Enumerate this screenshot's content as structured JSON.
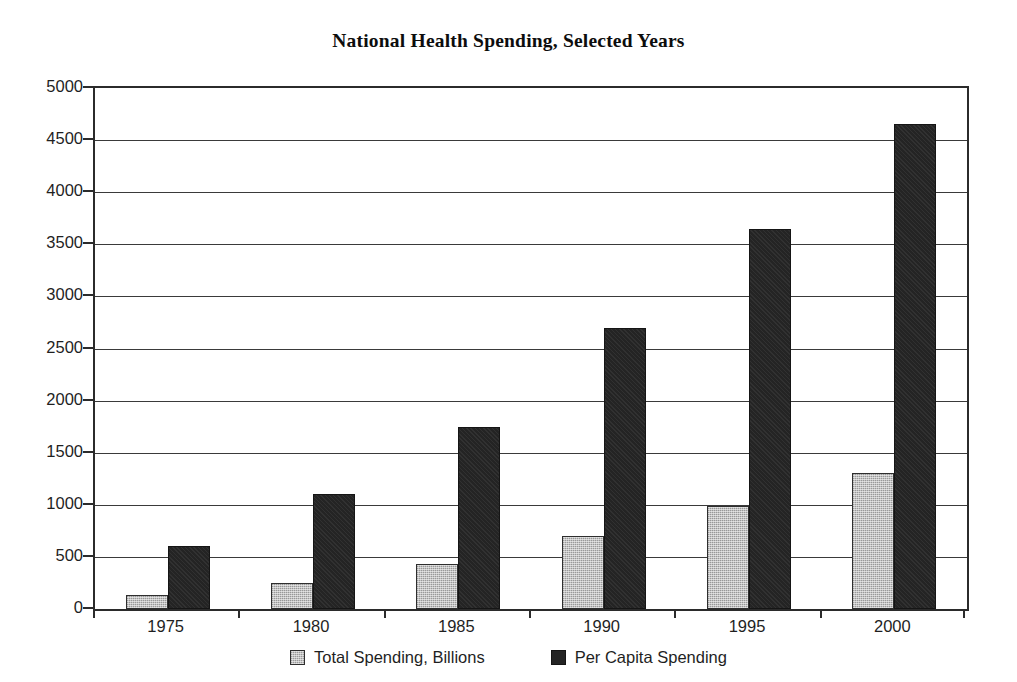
{
  "chart_data": {
    "type": "bar",
    "title": "National Health Spending, Selected Years",
    "xlabel": "",
    "ylabel": "",
    "categories": [
      "1975",
      "1980",
      "1985",
      "1990",
      "1995",
      "2000"
    ],
    "series": [
      {
        "name": "Total Spending, Billions",
        "color": "#c2c2c2",
        "values": [
          130,
          250,
          430,
          700,
          990,
          1310
        ]
      },
      {
        "name": "Per Capita Spending",
        "color": "#242424",
        "values": [
          600,
          1100,
          1750,
          2700,
          3650,
          4650
        ]
      }
    ],
    "ylim": [
      0,
      5000
    ],
    "yticks": [
      0,
      500,
      1000,
      1500,
      2000,
      2500,
      3000,
      3500,
      4000,
      4500,
      5000
    ],
    "ytick_labels": [
      "0",
      "500",
      "1000",
      "1500",
      "2000",
      "2500",
      "3000",
      "3500",
      "4000",
      "4500",
      "5000"
    ],
    "grid": true,
    "legend_position": "bottom-center",
    "frame": true
  },
  "legend": {
    "entries": [
      {
        "label": "Total Spending, Billions",
        "swatch": "legend-swatch-total"
      },
      {
        "label": "Per Capita Spending",
        "swatch": "legend-swatch-per-capita"
      }
    ]
  }
}
